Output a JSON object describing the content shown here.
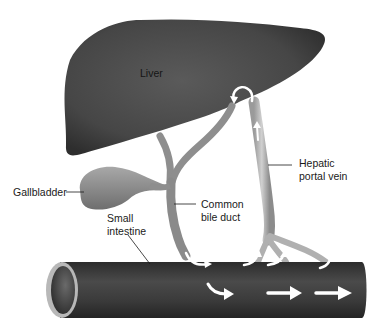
{
  "diagram": {
    "type": "anatomy",
    "labels": {
      "liver": "Liver",
      "hepatic_portal_vein_line1": "Hepatic",
      "hepatic_portal_vein_line2": "portal vein",
      "gallbladder": "Gallbladder",
      "common_bile_duct_line1": "Common",
      "common_bile_duct_line2": "bile duct",
      "small_intestine_line1": "Small",
      "small_intestine_line2": "intestine"
    },
    "colors": {
      "liver": "#4a4a4a",
      "intestine": "#3e3e3e",
      "duct": "#9a9a9a",
      "vein": "#b5b5b5",
      "arrow": "#ffffff"
    },
    "flow_arrows": [
      {
        "name": "bile-to-intestine"
      },
      {
        "name": "intestine-to-portal-vein-1"
      },
      {
        "name": "intestine-to-portal-vein-2"
      },
      {
        "name": "intestine-to-portal-vein-3"
      },
      {
        "name": "portal-vein-up"
      },
      {
        "name": "portal-vein-into-liver"
      },
      {
        "name": "intestinal-flow-1"
      },
      {
        "name": "intestinal-flow-2"
      },
      {
        "name": "intestinal-flow-3"
      }
    ]
  }
}
